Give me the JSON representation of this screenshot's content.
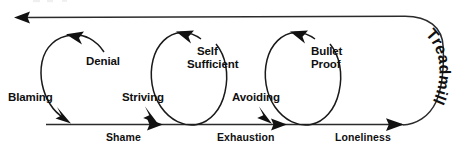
{
  "diagram": {
    "type": "cycle-flow-diagram",
    "background_color": "#ffffff",
    "line_color": "#2b2b2b",
    "text_color": "#101010",
    "baseline": {
      "labels": [
        {
          "id": "shame",
          "text": "Shame",
          "x": 106,
          "y": 141
        },
        {
          "id": "exhaustion",
          "text": "Exhaustion",
          "x": 217,
          "y": 141
        },
        {
          "id": "loneliness",
          "text": "Loneliness",
          "x": 335,
          "y": 141
        }
      ]
    },
    "loops": [
      {
        "id": "loop-1",
        "entry_label": {
          "text": "Blaming",
          "x": 8,
          "y": 101
        },
        "top_label": {
          "lines": [
            "Denial"
          ],
          "x": 86,
          "y": 65
        }
      },
      {
        "id": "loop-2",
        "entry_label": {
          "text": "Striving",
          "x": 122,
          "y": 101
        },
        "top_label": {
          "lines": [
            "Self",
            "Sufficient"
          ],
          "x": 197,
          "y": 55
        }
      },
      {
        "id": "loop-3",
        "entry_label": {
          "text": "Avoiding",
          "x": 232,
          "y": 101
        },
        "top_label": {
          "lines": [
            "Bullet",
            "Proof"
          ],
          "x": 311,
          "y": 55
        }
      }
    ],
    "return_path": {
      "label": "Treadmill",
      "direction": "right-to-left-along-top"
    }
  }
}
